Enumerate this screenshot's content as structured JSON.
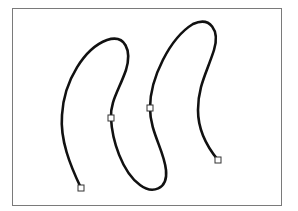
{
  "diagram": {
    "type": "bezier-path",
    "frame": {
      "x": 12,
      "y": 8,
      "width": 270,
      "height": 198,
      "stroke": "#7a7a7a"
    },
    "curve": {
      "stroke": "#111111",
      "stroke_width": 2.6,
      "path": "M81,188 C70,165 60,140 62,115 C64,80 85,48 107,40 C125,34 132,50 126,70 C119,90 110,102 111,118 C112,140 122,172 140,185 C152,194 168,190 166,170 C164,150 150,132 150,108 C150,78 170,38 193,24 C210,16 220,30 214,50 C207,72 198,86 198,110 C198,132 208,148 218,160"
    },
    "anchors": [
      {
        "x": 81,
        "y": 188
      },
      {
        "x": 111,
        "y": 118
      },
      {
        "x": 150,
        "y": 108
      },
      {
        "x": 218,
        "y": 160
      }
    ],
    "anchor_style": {
      "size": 6,
      "fill": "#ffffff",
      "stroke": "#333333"
    }
  }
}
